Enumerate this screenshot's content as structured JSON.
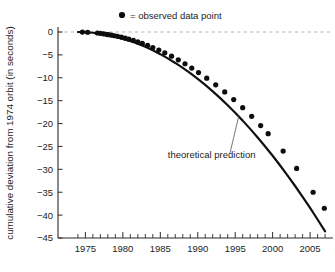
{
  "chart_data": {
    "type": "scatter",
    "title": "",
    "subtitle": "",
    "xlabel": "",
    "ylabel": "cumulative deviation from 1974 orbit (in seconds)",
    "xlim": [
      1972.5,
      2008.0
    ],
    "ylim": [
      -45.5,
      1.5
    ],
    "grid": false,
    "legend_position": "top-center",
    "legend": [
      {
        "marker": "filled-circle",
        "label": "= observed data point",
        "color": "#0d0d0d"
      }
    ],
    "annotations": [
      {
        "text": "theoretical prediction",
        "x": 1986.0,
        "y": -27.5,
        "leader_to_x": 1995.5,
        "leader_to_y": -18.2
      },
      {
        "type": "reference-line",
        "orientation": "horizontal",
        "y": 0,
        "style": "dashed",
        "color": "#b4b4b4"
      }
    ],
    "xticks_major": [
      1975,
      1980,
      1985,
      1990,
      1995,
      2000,
      2005
    ],
    "xticks_major_labels": [
      "1975",
      "1980",
      "1985",
      "1990",
      "1995",
      "2000",
      "2005"
    ],
    "xticks_minor_start": 1974,
    "xticks_minor_end": 2007,
    "xticks_minor_step": 1,
    "yticks": [
      0,
      -5,
      -10,
      -15,
      -20,
      -25,
      -30,
      -35,
      -40,
      -45
    ],
    "yticks_labels": [
      "0",
      "−5",
      "−10",
      "−15",
      "−20",
      "−25",
      "−30",
      "−35",
      "−40",
      "−45"
    ],
    "series": [
      {
        "name": "theoretical prediction",
        "type": "line",
        "color": "#111111",
        "x": [
          1974.0,
          1975.0,
          1976.0,
          1977.0,
          1978.0,
          1979.0,
          1980.0,
          1981.0,
          1982.0,
          1983.0,
          1984.0,
          1985.0,
          1986.0,
          1987.0,
          1988.0,
          1989.0,
          1990.0,
          1991.0,
          1992.0,
          1993.0,
          1994.0,
          1995.0,
          1996.0,
          1997.0,
          1998.0,
          1999.0,
          2000.0,
          2001.0,
          2002.0,
          2003.0,
          2004.0,
          2005.0,
          2006.0,
          2007.0
        ],
        "y": [
          0.0,
          -0.04,
          -0.16,
          -0.36,
          -0.64,
          -1.0,
          -1.44,
          -1.96,
          -2.56,
          -3.24,
          -4.0,
          -4.84,
          -5.76,
          -6.76,
          -7.84,
          -9.0,
          -10.24,
          -11.56,
          -12.96,
          -14.44,
          -16.0,
          -17.64,
          -19.36,
          -21.16,
          -23.04,
          -25.0,
          -27.04,
          -29.16,
          -31.36,
          -33.64,
          -36.0,
          -38.44,
          -40.96,
          -43.56
        ]
      },
      {
        "name": "observed data point",
        "type": "scatter",
        "color": "#0d0d0d",
        "x": [
          1974.6,
          1975.3,
          1976.6,
          1977.0,
          1977.4,
          1977.8,
          1978.1,
          1978.5,
          1978.9,
          1979.3,
          1979.8,
          1980.3,
          1980.8,
          1981.4,
          1982.0,
          1982.6,
          1983.3,
          1984.0,
          1984.8,
          1985.6,
          1986.5,
          1987.4,
          1988.3,
          1989.2,
          1990.1,
          1991.2,
          1992.4,
          1993.6,
          1994.8,
          1996.0,
          1997.2,
          1998.4,
          1999.4,
          2001.4,
          2003.2,
          2005.4,
          2006.9
        ],
        "y": [
          -0.02,
          -0.05,
          -0.22,
          -0.3,
          -0.39,
          -0.5,
          -0.58,
          -0.7,
          -0.82,
          -0.95,
          -1.14,
          -1.35,
          -1.57,
          -1.85,
          -2.16,
          -2.5,
          -2.93,
          -3.39,
          -3.94,
          -4.54,
          -5.27,
          -6.07,
          -6.93,
          -7.87,
          -8.86,
          -10.09,
          -11.54,
          -13.09,
          -14.75,
          -16.54,
          -18.43,
          -20.44,
          -22.21,
          -26.0,
          -29.8,
          -35.0,
          -38.5
        ]
      }
    ]
  },
  "legend": {
    "marker_name": "observed-data-point-marker",
    "label": "= observed data point"
  },
  "axes": {
    "ylabel": "cumulative deviation from 1974 orbit (in seconds)",
    "xlabel": ""
  },
  "annotation": {
    "theoretical_prediction": "theoretical prediction"
  }
}
